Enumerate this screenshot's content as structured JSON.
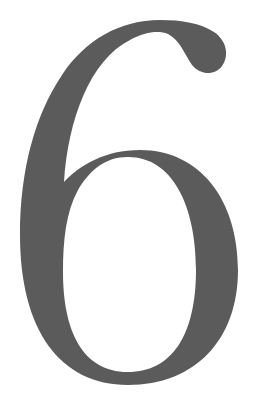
{
  "numeral": {
    "text": "6",
    "color": "#5b5b5b",
    "background": "#ffffff"
  }
}
